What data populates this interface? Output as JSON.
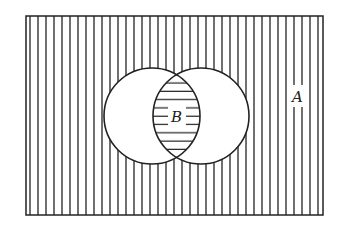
{
  "diagram": {
    "type": "venn",
    "universe_label": "A",
    "intersection_label": "B",
    "stroke_color": "#222222",
    "background_color": "#ffffff",
    "universe": {
      "x": 26,
      "y": 16,
      "width": 297,
      "height": 199,
      "hatch": "vertical",
      "hatch_spacing": 8
    },
    "circles": [
      {
        "name": "left",
        "cx": 152,
        "cy": 116,
        "r": 48
      },
      {
        "name": "right",
        "cx": 201,
        "cy": 116,
        "r": 48
      }
    ],
    "intersection": {
      "hatch": "horizontal",
      "hatch_spacing": 8
    }
  }
}
